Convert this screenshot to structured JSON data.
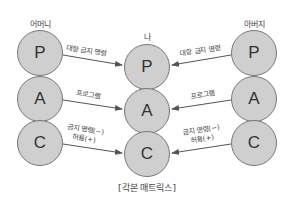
{
  "diagram": {
    "columns": [
      {
        "id": "mother",
        "label": "어머니",
        "states": [
          "P",
          "A",
          "C"
        ]
      },
      {
        "id": "self",
        "label": "나",
        "states": [
          "P",
          "A",
          "C"
        ]
      },
      {
        "id": "father",
        "label": "아버지",
        "states": [
          "P",
          "A",
          "C"
        ]
      }
    ],
    "edges": [
      {
        "from": "mother.P",
        "to": "self.P",
        "label": "대항 금지 명령"
      },
      {
        "from": "mother.A",
        "to": "self.A",
        "label": "프로그램"
      },
      {
        "from": "mother.C",
        "to": "self.C",
        "label_line1": "금지 명령(−)",
        "label_line2": "허용(+)"
      },
      {
        "from": "father.P",
        "to": "self.P",
        "label": "대항 금지 명령"
      },
      {
        "from": "father.A",
        "to": "self.A",
        "label": "프로그램"
      },
      {
        "from": "father.C",
        "to": "self.C",
        "label_line1": "금지 명령(−)",
        "label_line2": "허용(+)"
      }
    ],
    "caption": "[각본 매트릭스]",
    "colors": {
      "circle_fill": "#cfcfcf",
      "circle_stroke": "#777777",
      "arrow": "#555555"
    }
  }
}
